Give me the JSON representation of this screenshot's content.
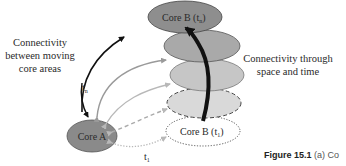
{
  "diagram": {
    "left_label": [
      "Connectivity",
      "between moving",
      "core areas"
    ],
    "right_label": [
      "Connectivity through",
      "space and time"
    ],
    "nodes": [
      {
        "id": "core_b_tn",
        "label": "Core B (t",
        "sub": "n",
        "suffix": ")",
        "fill": "#8e8e8e",
        "border": "solid"
      },
      {
        "id": "intermediate_1",
        "label": "",
        "fill": "#a9a9a9",
        "border": "solid"
      },
      {
        "id": "intermediate_2",
        "label": "",
        "fill": "#c6c6c6",
        "border": "solid"
      },
      {
        "id": "intermediate_3",
        "label": "",
        "fill": "#d9d9d9",
        "border": "dashed"
      },
      {
        "id": "core_b_t1",
        "label": "Core B (t",
        "sub": "1",
        "suffix": ")",
        "fill": "#ffffff",
        "border": "dotted"
      },
      {
        "id": "core_a",
        "label": "Core A",
        "fill": "#8a8a8a",
        "border": "solid"
      }
    ],
    "edge_labels": {
      "tn": {
        "main": "t",
        "sub": "n"
      },
      "t1": {
        "main": "t",
        "sub": "1"
      }
    },
    "colors": {
      "arrow_dark": "#111111",
      "arrow_mid": "#9a9a9a",
      "arrow_light": "#b8b8b8",
      "outline": "#555555"
    }
  },
  "caption": {
    "bold": "Figure 15.1",
    "rest": "(a) Co"
  }
}
